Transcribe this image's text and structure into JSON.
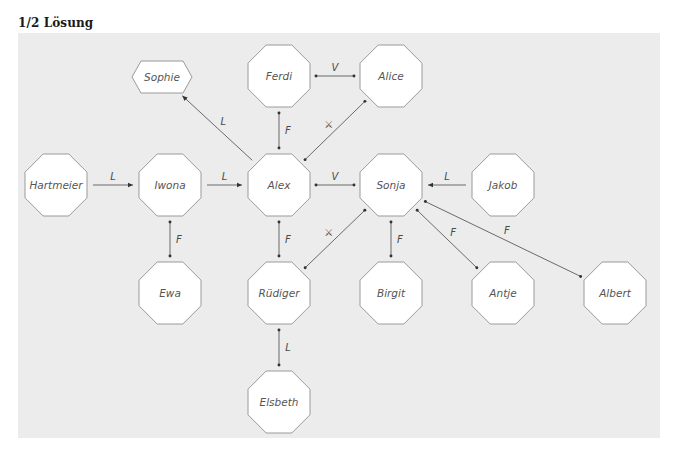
{
  "title": "1/2 Lösung",
  "colors": {
    "panel_background": "#ececec",
    "node_fill": "#ffffff",
    "node_stroke": "#9a9a9a",
    "edge": "#6a6a6a",
    "text": "#555555"
  },
  "nodes": [
    {
      "id": "sophie",
      "label": "Sophie",
      "shape": "hexagon",
      "x": 162,
      "y": 77
    },
    {
      "id": "ferdi",
      "label": "Ferdi",
      "shape": "octagon",
      "x": 279,
      "y": 76
    },
    {
      "id": "alice",
      "label": "Alice",
      "shape": "octagon",
      "x": 391,
      "y": 76
    },
    {
      "id": "hartmeier",
      "label": "Hartmeier",
      "shape": "octagon",
      "x": 56,
      "y": 185
    },
    {
      "id": "iwona",
      "label": "Iwona",
      "shape": "octagon",
      "x": 170,
      "y": 185
    },
    {
      "id": "alex",
      "label": "Alex",
      "shape": "octagon",
      "x": 279,
      "y": 185
    },
    {
      "id": "sonja",
      "label": "Sonja",
      "shape": "octagon",
      "x": 391,
      "y": 185
    },
    {
      "id": "jakob",
      "label": "Jakob",
      "shape": "octagon",
      "x": 503,
      "y": 185
    },
    {
      "id": "ewa",
      "label": "Ewa",
      "shape": "octagon",
      "x": 170,
      "y": 293
    },
    {
      "id": "ruediger",
      "label": "Rüdiger",
      "shape": "octagon",
      "x": 279,
      "y": 293
    },
    {
      "id": "birgit",
      "label": "Birgit",
      "shape": "octagon",
      "x": 391,
      "y": 293
    },
    {
      "id": "antje",
      "label": "Antje",
      "shape": "octagon",
      "x": 503,
      "y": 293
    },
    {
      "id": "albert",
      "label": "Albert",
      "shape": "octagon",
      "x": 615,
      "y": 293
    },
    {
      "id": "elsbeth",
      "label": "Elsbeth",
      "shape": "octagon",
      "x": 279,
      "y": 402
    }
  ],
  "edges": [
    {
      "from": "hartmeier",
      "to": "iwona",
      "label": "L",
      "direction": "forward"
    },
    {
      "from": "iwona",
      "to": "alex",
      "label": "L",
      "direction": "forward"
    },
    {
      "from": "alex",
      "to": "sophie",
      "label": "L",
      "direction": "forward"
    },
    {
      "from": "ferdi",
      "to": "alice",
      "label": "V",
      "direction": "both"
    },
    {
      "from": "ferdi",
      "to": "alex",
      "label": "F",
      "direction": "both"
    },
    {
      "from": "alex",
      "to": "alice",
      "label": "⚔",
      "direction": "both"
    },
    {
      "from": "alex",
      "to": "sonja",
      "label": "V",
      "direction": "both"
    },
    {
      "from": "jakob",
      "to": "sonja",
      "label": "L",
      "direction": "forward"
    },
    {
      "from": "iwona",
      "to": "ewa",
      "label": "F",
      "direction": "both"
    },
    {
      "from": "alex",
      "to": "ruediger",
      "label": "F",
      "direction": "both"
    },
    {
      "from": "ruediger",
      "to": "sonja",
      "label": "⚔",
      "direction": "both"
    },
    {
      "from": "sonja",
      "to": "birgit",
      "label": "F",
      "direction": "both"
    },
    {
      "from": "sonja",
      "to": "antje",
      "label": "F",
      "direction": "both"
    },
    {
      "from": "sonja",
      "to": "albert",
      "label": "F",
      "direction": "both"
    },
    {
      "from": "ruediger",
      "to": "elsbeth",
      "label": "L",
      "direction": "both"
    }
  ]
}
